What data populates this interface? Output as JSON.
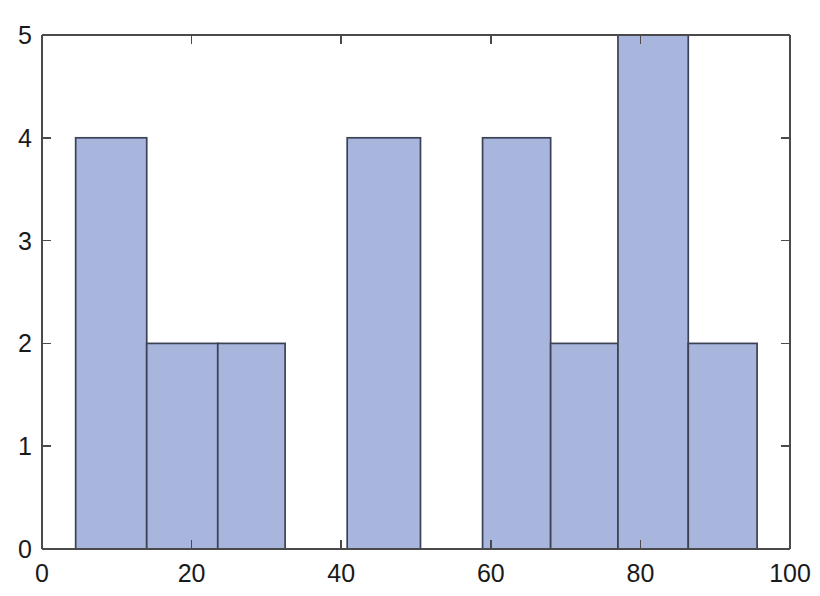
{
  "chart_data": {
    "type": "bar",
    "title": "",
    "subtitle": "",
    "xlabel": "",
    "ylabel": "",
    "xlim": [
      0,
      100
    ],
    "ylim": [
      0,
      5
    ],
    "grid": false,
    "legend": null,
    "x_ticks": [
      0,
      20,
      40,
      60,
      80,
      100
    ],
    "x_tick_labels": [
      "0",
      "20",
      "40",
      "60",
      "80",
      "100"
    ],
    "y_ticks": [
      0,
      1,
      2,
      3,
      4,
      5
    ],
    "y_tick_labels": [
      "0",
      "1",
      "2",
      "3",
      "4",
      "5"
    ],
    "bar_color": "#a8b6dd",
    "bar_edge_color": "#3b4256",
    "axis_color": "#4a4a4a",
    "bins": [
      {
        "label": "5-14",
        "x_start": 4.5,
        "x_end": 14.0,
        "value": 4
      },
      {
        "label": "14-24",
        "x_start": 14.0,
        "x_end": 23.5,
        "value": 2
      },
      {
        "label": "24-33",
        "x_start": 23.5,
        "x_end": 32.5,
        "value": 2
      },
      {
        "label": "41-50",
        "x_start": 40.8,
        "x_end": 50.6,
        "value": 4
      },
      {
        "label": "59-68",
        "x_start": 58.9,
        "x_end": 68.0,
        "value": 4
      },
      {
        "label": "68-78",
        "x_start": 68.0,
        "x_end": 77.0,
        "value": 2
      },
      {
        "label": "78-87",
        "x_start": 77.0,
        "x_end": 86.4,
        "value": 5
      },
      {
        "label": "87-96",
        "x_start": 86.4,
        "x_end": 95.6,
        "value": 2
      }
    ],
    "categories": [
      "5-14",
      "14-24",
      "24-33",
      "41-50",
      "59-68",
      "68-78",
      "78-87",
      "87-96"
    ],
    "values": [
      4,
      2,
      2,
      4,
      4,
      2,
      5,
      2
    ]
  }
}
